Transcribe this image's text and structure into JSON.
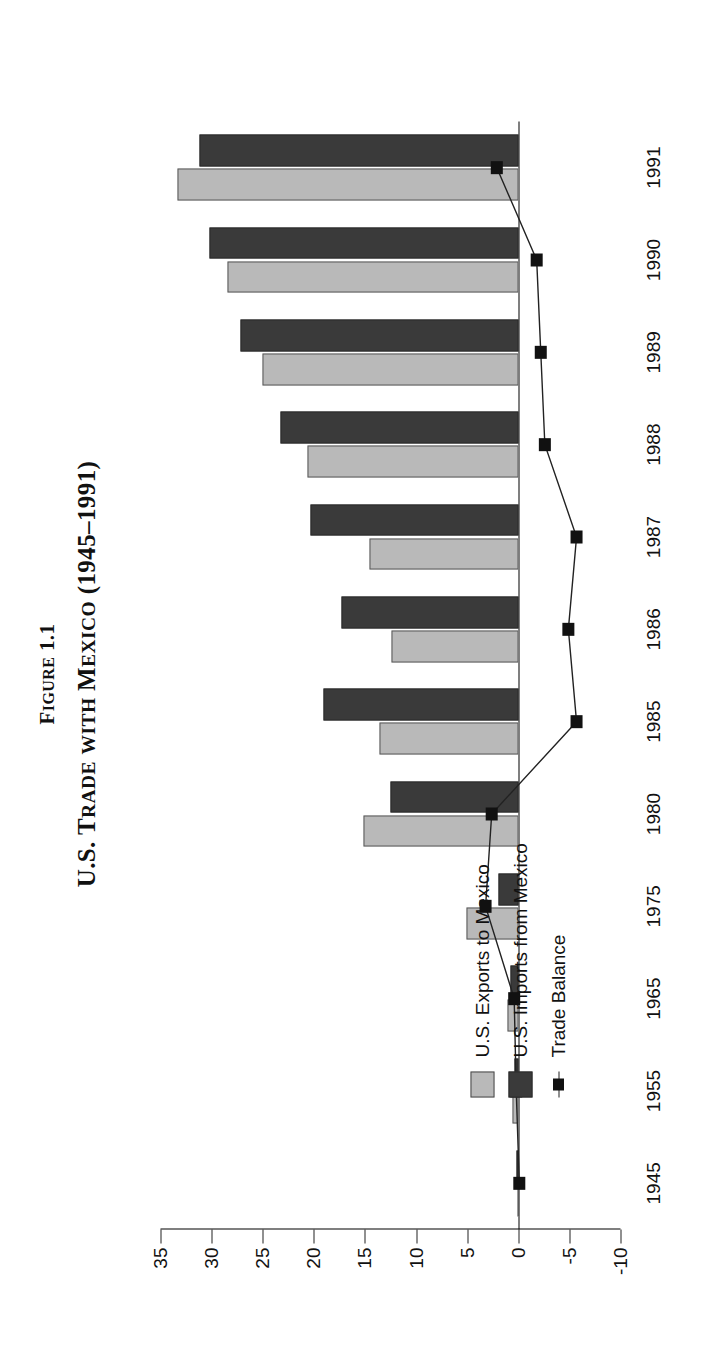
{
  "figure": {
    "number_label": "Figure 1.1",
    "title": "U.S. Trade with Mexico (1945–1991)"
  },
  "legend": {
    "position": "inside-left",
    "items": [
      {
        "label": "U.S. Exports to Mexico",
        "type": "swatch",
        "color": "#b9b9b9"
      },
      {
        "label": "U.S. Imports from Mexico",
        "type": "swatch",
        "color": "#3a3a3a"
      },
      {
        "label": "Trade Balance",
        "type": "line-marker",
        "color": "#111111"
      }
    ]
  },
  "chart_data": {
    "type": "bar",
    "orientation": "horizontal-rotated",
    "title": "U.S. Trade with Mexico (1945–1991)",
    "xlabel": "",
    "ylabel": "$ Billions",
    "ylim": [
      -10,
      35
    ],
    "ytick_labels": [
      "35",
      "30",
      "25",
      "20",
      "15",
      "10",
      "5",
      "0",
      "-5",
      "-10"
    ],
    "yticks": [
      35,
      30,
      25,
      20,
      15,
      10,
      5,
      0,
      -5,
      -10
    ],
    "grid": false,
    "categories": [
      "1945",
      "1955",
      "1965",
      "1975",
      "1980",
      "1985",
      "1986",
      "1987",
      "1988",
      "1989",
      "1990",
      "1991"
    ],
    "series": [
      {
        "name": "U.S. Exports to Mexico",
        "color": "#b9b9b9",
        "values": [
          0.1,
          0.6,
          1.1,
          5.1,
          15.1,
          13.6,
          12.4,
          14.6,
          20.6,
          25.0,
          28.4,
          33.3
        ]
      },
      {
        "name": "U.S. Imports from Mexico",
        "color": "#3a3a3a",
        "values": [
          0.15,
          0.4,
          0.75,
          1.9,
          12.5,
          19.1,
          17.3,
          20.3,
          23.3,
          27.2,
          30.2,
          31.2
        ]
      },
      {
        "name": "Trade Balance",
        "color": "#111111",
        "type": "line",
        "values": [
          -0.1,
          0.2,
          0.4,
          3.2,
          2.6,
          -5.7,
          -4.9,
          -5.7,
          -2.6,
          -2.2,
          -1.8,
          2.1
        ]
      }
    ]
  },
  "axis": {
    "value_axis_title": "$ Billions"
  }
}
